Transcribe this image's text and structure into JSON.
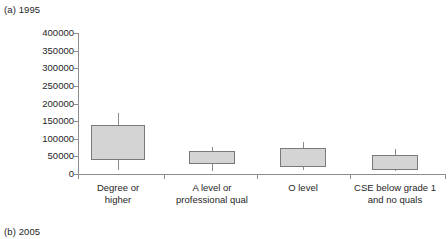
{
  "panels": {
    "a_caption": "(a) 1995",
    "b_caption": "(b) 2005"
  },
  "chart_data": {
    "type": "box",
    "title": "(a) 1995",
    "xlabel": "",
    "ylabel": "",
    "ylim": [
      0,
      400000
    ],
    "ytick_values": [
      0,
      50000,
      100000,
      150000,
      200000,
      250000,
      300000,
      350000,
      400000
    ],
    "ytick_labels": [
      "0",
      "50000",
      "100000",
      "150000",
      "200000",
      "250000",
      "300000",
      "350000",
      "400000"
    ],
    "grid": false,
    "legend": null,
    "categories": [
      "Degree or higher",
      "A level or professional qual",
      "O level",
      "CSE below grade 1 and no quals"
    ],
    "boxes": [
      {
        "category": "Degree or higher",
        "whisker_low": 12000,
        "q1": 40000,
        "median": 85000,
        "q3": 140000,
        "whisker_high": 172000
      },
      {
        "category": "A level or professional qual",
        "whisker_low": 8000,
        "q1": 27000,
        "median": 48000,
        "q3": 66000,
        "whisker_high": 78000
      },
      {
        "category": "O level",
        "whisker_low": 10000,
        "q1": 20000,
        "median": 50000,
        "q3": 75000,
        "whisker_high": 90000
      },
      {
        "category": "CSE below grade 1 and no quals",
        "whisker_low": 8000,
        "q1": 12000,
        "median": 36000,
        "q3": 55000,
        "whisker_high": 72000
      }
    ]
  },
  "axis": {
    "ticks": [
      {
        "label": "400000",
        "value": 400000
      },
      {
        "label": "350000",
        "value": 350000
      },
      {
        "label": "300000",
        "value": 300000
      },
      {
        "label": "250000",
        "value": 250000
      },
      {
        "label": "200000",
        "value": 200000
      },
      {
        "label": "150000",
        "value": 150000
      },
      {
        "label": "100000",
        "value": 100000
      },
      {
        "label": "50000",
        "value": 50000
      },
      {
        "label": "0",
        "value": 0
      }
    ]
  },
  "x_labels": [
    {
      "line1": "Degree or",
      "line2": "higher"
    },
    {
      "line1": "A level or",
      "line2": "professional qual"
    },
    {
      "line1": "O level",
      "line2": ""
    },
    {
      "line1": "CSE below grade 1",
      "line2": "and no quals"
    }
  ],
  "colors": {
    "box_fill": "#d4d4d4",
    "box_stroke": "#7a7a7a",
    "axis": "#8d8d8d",
    "text": "#262626"
  }
}
